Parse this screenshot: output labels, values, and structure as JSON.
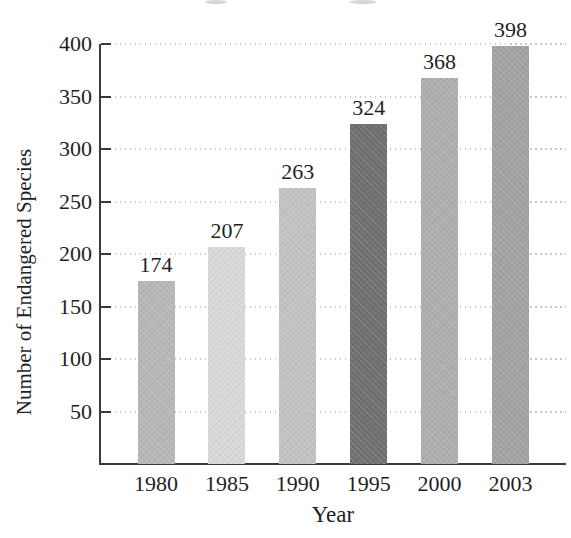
{
  "chart_data": {
    "type": "bar",
    "title": "",
    "categories": [
      "1980",
      "1985",
      "1990",
      "1995",
      "2000",
      "2003"
    ],
    "values": [
      174,
      207,
      263,
      324,
      368,
      398
    ],
    "value_labels": [
      "174",
      "207",
      "263",
      "324",
      "368",
      "398"
    ],
    "bar_colors": [
      "#b7b7b7",
      "#d9d9d9",
      "#c2c2c2",
      "#707070",
      "#aeaeae",
      "#a3a3a3"
    ],
    "xlabel": "Year",
    "ylabel": "Number of Endangered Species",
    "ylim": [
      0,
      400
    ],
    "yticks": [
      50,
      100,
      150,
      200,
      250,
      300,
      350,
      400
    ],
    "grid": "horizontal-dotted",
    "legend": "none"
  },
  "style_colors": {
    "axis": "#3a3a3a",
    "grid_dots": "#c8c8c8",
    "text": "#1f1f1f",
    "background": "#ffffff"
  }
}
